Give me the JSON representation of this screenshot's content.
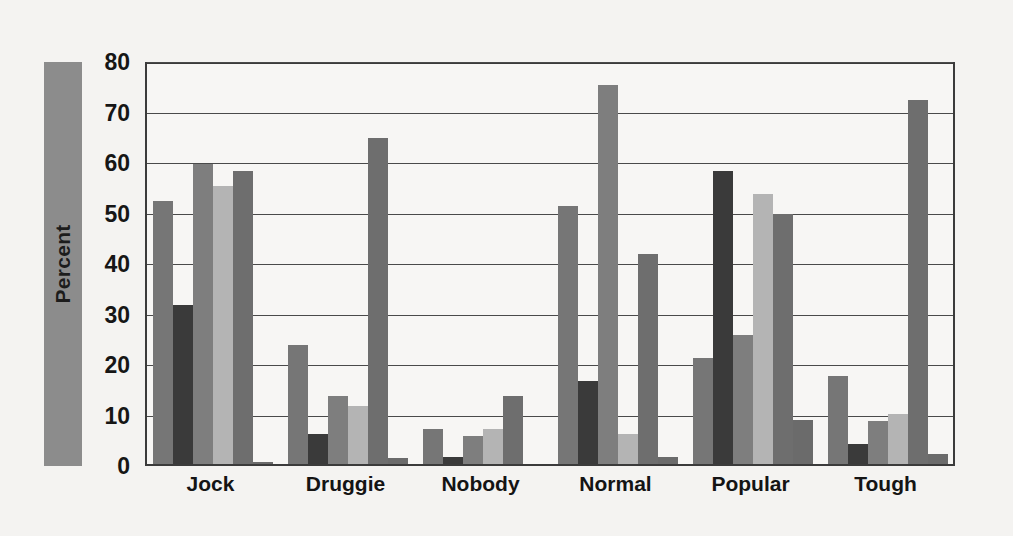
{
  "chart_data": {
    "type": "bar",
    "title": "",
    "subtitle": "",
    "xlabel": "",
    "ylabel": "Percent",
    "ylim": [
      0,
      80
    ],
    "yticks": [
      0,
      10,
      20,
      30,
      40,
      50,
      60,
      70,
      80
    ],
    "ytick_labels": [
      "0",
      "10",
      "20",
      "30",
      "40",
      "50",
      "60",
      "70",
      "80"
    ],
    "grid": "horizontal",
    "legend": "none",
    "categories": [
      "Jock",
      "Druggie",
      "Nobody",
      "Normal",
      "Popular",
      "Tough"
    ],
    "series": [
      {
        "name": "Series 1",
        "color": "#767676",
        "values": [
          52.0,
          23.5,
          7.0,
          51.0,
          21.0,
          17.5
        ]
      },
      {
        "name": "Series 2",
        "color": "#3a3a3a",
        "values": [
          31.5,
          6.0,
          1.3,
          16.5,
          58.0,
          4.0
        ]
      },
      {
        "name": "Series 3",
        "color": "#7e7e7e",
        "values": [
          59.5,
          13.5,
          5.5,
          75.0,
          25.5,
          8.5
        ]
      },
      {
        "name": "Series 4",
        "color": "#b4b4b4",
        "values": [
          55.0,
          11.5,
          7.0,
          6.0,
          53.5,
          10.0
        ]
      },
      {
        "name": "Series 5",
        "color": "#6e6e6e",
        "values": [
          58.0,
          64.5,
          13.5,
          41.5,
          49.5,
          72.0
        ]
      },
      {
        "name": "Series 6",
        "color": "#6b6b6b",
        "values": [
          0.4,
          1.2,
          0.0,
          1.3,
          8.8,
          2.0
        ]
      }
    ]
  },
  "axis": {
    "frame_color": "#3b3b3b",
    "grid_color": "#4a4a4a",
    "ylabel_bar_color": "#8c8c8c",
    "background_color": "#f4f3f1"
  }
}
